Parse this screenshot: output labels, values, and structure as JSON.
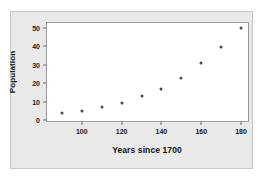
{
  "chart_data": {
    "type": "scatter",
    "title": "",
    "xlabel": "Years since 1700",
    "ylabel": "Population",
    "x": [
      90,
      100,
      110,
      120,
      130,
      140,
      150,
      160,
      170,
      180
    ],
    "values": [
      4,
      5.2,
      7.2,
      9.5,
      12.8,
      17,
      22.8,
      31,
      39.5,
      50
    ],
    "xlim": [
      82,
      184
    ],
    "ylim": [
      -1,
      53
    ],
    "xticks": [
      100,
      120,
      140,
      160,
      180
    ],
    "xtick_labels": [
      "100",
      "120",
      "140",
      "160",
      "180"
    ],
    "yticks": [
      0,
      10,
      20,
      30,
      40,
      50
    ],
    "ytick_labels": [
      "0",
      "10",
      "20",
      "30",
      "40",
      "50"
    ],
    "grid": false,
    "legend": null,
    "marker_color": "#4a4a4a",
    "plot_background": "#ffffff",
    "panel_background": "#e9e9e9",
    "axis_color": "#9a9a9a"
  }
}
